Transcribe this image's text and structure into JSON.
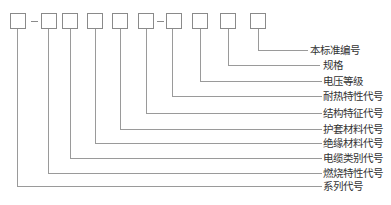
{
  "diagram": {
    "type": "code-structure",
    "boxes": 10,
    "labels": [
      "本标准编号",
      "规格",
      "电压等级",
      "耐热特性代号",
      "结构特征代号",
      "护套材料代号",
      "绝缘材料代号",
      "电缆类别代号",
      "燃烧特性代号",
      "系列代号"
    ]
  }
}
